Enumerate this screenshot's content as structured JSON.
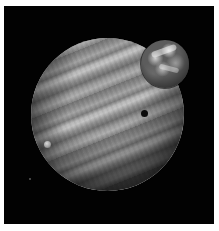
{
  "image": {
    "subject": "space scene",
    "description": "Banded gas giant planet with a large Earth-like moon at upper right, a small moon shadow on the planet's disk, and a small moon at left",
    "colors": {
      "background": "#020202",
      "frame_border": "#ffffff",
      "planet_base": "#8a8a8a",
      "moon_base": "#5c5c5c",
      "shadow_dot": "#0a0a0a"
    },
    "elements": [
      {
        "name": "gas-giant",
        "center": [
          107,
          120
        ],
        "radius": 76
      },
      {
        "name": "earth-like-moon",
        "center": [
          161,
          58
        ],
        "radius": 24
      },
      {
        "name": "moon-shadow",
        "center": [
          141,
          108
        ],
        "radius": 3
      },
      {
        "name": "small-moon",
        "center": [
          44,
          139
        ],
        "radius": 3
      },
      {
        "name": "distant-star",
        "center": [
          26,
          173
        ],
        "radius": 1
      }
    ]
  }
}
